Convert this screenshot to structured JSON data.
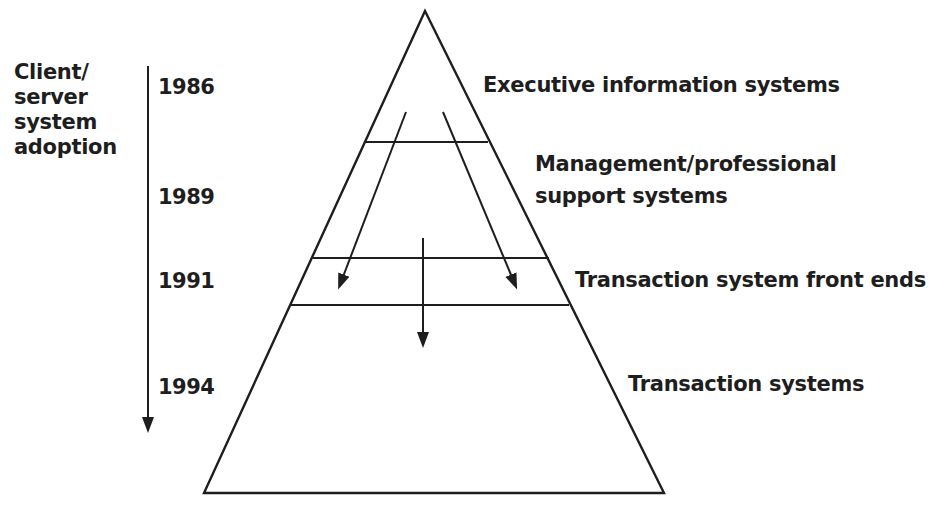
{
  "axis": {
    "title_lines": [
      "Client/",
      "server",
      "system",
      "adoption"
    ],
    "years": [
      "1986",
      "1989",
      "1991",
      "1994"
    ]
  },
  "pyramid": {
    "levels": [
      {
        "label_lines": [
          "Executive information systems"
        ],
        "year": "1986"
      },
      {
        "label_lines": [
          "Management/professional",
          "support systems"
        ],
        "year": "1989"
      },
      {
        "label_lines": [
          "Transaction system front ends"
        ],
        "year": "1991"
      },
      {
        "label_lines": [
          "Transaction systems"
        ],
        "year": "1994"
      }
    ]
  },
  "colors": {
    "ink": "#1e1e1e",
    "background": "#ffffff"
  }
}
